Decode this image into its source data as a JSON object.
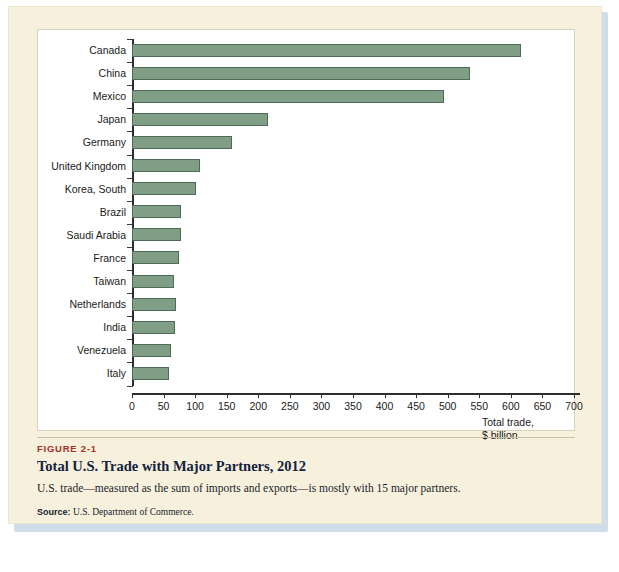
{
  "figure": {
    "number": "FIGURE 2-1",
    "title": "Total U.S. Trade with Major Partners, 2012",
    "description": "U.S. trade—measured as the sum of imports and exports—is mostly with 15 major partners.",
    "source_label": "Source:",
    "source_text": "U.S. Department of Commerce."
  },
  "colors": {
    "bar_fill": "#7f9e85",
    "bar_stroke": "#4d6b55",
    "figure_background": "#f7f0dd",
    "panel_background": "#ffffff",
    "figure_number": "#a43123",
    "title": "#13233d",
    "axis": "#2d2d2d"
  },
  "chart_data": {
    "type": "bar",
    "orientation": "horizontal",
    "title": "Total U.S. Trade with Major Partners, 2012",
    "xlabel": "Total trade, $ billion",
    "ylabel": "",
    "xlim": [
      0,
      700
    ],
    "xticks": [
      0,
      50,
      100,
      150,
      200,
      250,
      300,
      350,
      400,
      450,
      500,
      550,
      600,
      650,
      700
    ],
    "grid": false,
    "legend": null,
    "categories": [
      "Canada",
      "China",
      "Mexico",
      "Japan",
      "Germany",
      "United Kingdom",
      "Korea, South",
      "Brazil",
      "Saudi Arabia",
      "France",
      "Taiwan",
      "Netherlands",
      "India",
      "Venezuela",
      "Italy"
    ],
    "values": [
      616,
      536,
      494,
      216,
      158,
      107,
      101,
      78,
      77,
      74,
      67,
      70,
      68,
      61,
      58
    ],
    "axis_title_lines": [
      "Total trade,",
      "$ billion"
    ]
  }
}
